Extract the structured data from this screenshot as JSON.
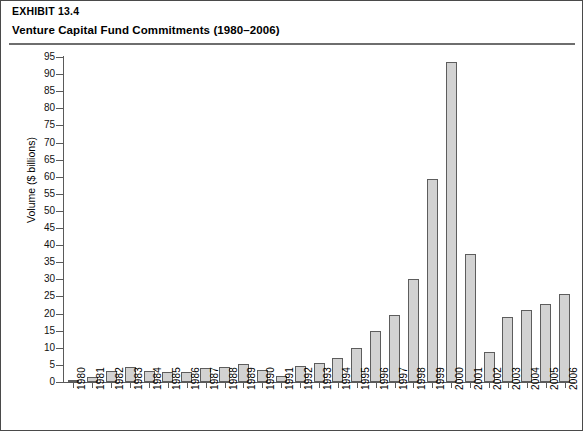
{
  "header": {
    "exhibit_label": "EXHIBIT 13.4",
    "title": "Venture Capital Fund Commitments (1980–2006)"
  },
  "chart_data": {
    "type": "bar",
    "title": "Venture Capital Fund Commitments (1980–2006)",
    "xlabel": "",
    "ylabel": "Volume ($ billions)",
    "ylim": [
      0,
      95
    ],
    "ytick_step": 5,
    "grid": false,
    "legend": null,
    "categories": [
      "1980",
      "1981",
      "1982",
      "1983",
      "1984",
      "1985",
      "1986",
      "1987",
      "1988",
      "1989",
      "1990",
      "1991",
      "1992",
      "1993",
      "1994",
      "1995",
      "1996",
      "1997",
      "1998",
      "1999",
      "2000",
      "2001",
      "2002",
      "2003",
      "2004",
      "2005",
      "2006"
    ],
    "values": [
      0.7,
      1.4,
      3.2,
      4.4,
      3.3,
      2.9,
      3.0,
      4.0,
      4.5,
      5.3,
      3.4,
      1.7,
      4.6,
      5.5,
      7.0,
      9.9,
      14.8,
      19.7,
      30.2,
      59.4,
      93.4,
      37.3,
      8.8,
      18.9,
      21.1,
      22.8,
      25.7
    ],
    "bar_color": "#d2d2d2",
    "bar_border_color": "#5d5d5d",
    "ytick_labels": [
      "0",
      "5",
      "10",
      "15",
      "20",
      "25",
      "30",
      "35",
      "40",
      "45",
      "50",
      "55",
      "60",
      "65",
      "70",
      "75",
      "80",
      "85",
      "90",
      "95"
    ]
  }
}
